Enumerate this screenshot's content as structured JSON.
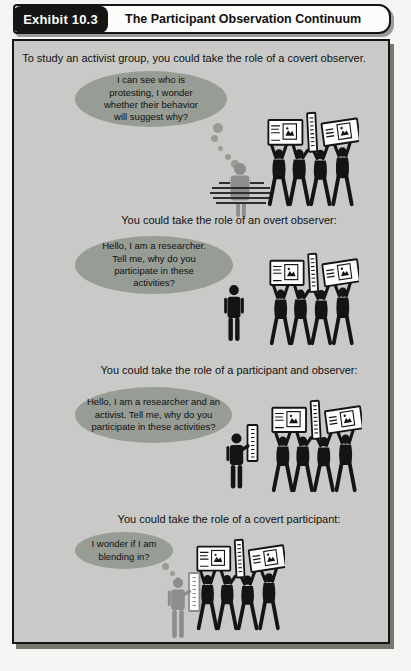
{
  "header": {
    "exhibit_label": "Exhibit 10.3",
    "title": "The Participant Observation Continuum"
  },
  "sections": [
    {
      "intro": "To study an activist group, you could take the role of a covert observer.",
      "bubble": "I can see who is protesting, I wonder whether their behavior will suggest why?",
      "bubble_type": "thought",
      "scene": "covert-observer-behind-hedge-watching-protest-group"
    },
    {
      "intro": "You could take the role of an overt observer:",
      "bubble": "Hello, I am a researcher. Tell me, why do you participate in these activities?",
      "bubble_type": "speech",
      "scene": "overt-observer-standing-beside-protest-group"
    },
    {
      "intro": "You could take the role of a participant and observer:",
      "bubble": "Hello, I am a researcher and an activist. Tell me, why do you participate in these activities?",
      "bubble_type": "speech",
      "scene": "participant-observer-holding-sign-beside-protest-group"
    },
    {
      "intro": "You could take the role of a covert participant:",
      "bubble": "I wonder if I am blending in?",
      "bubble_type": "thought",
      "scene": "covert-participant-with-sign-blending-into-protest-group"
    }
  ],
  "colors": {
    "panel_bg": "#c9c9c7",
    "bubble": "#979c94",
    "figure_black": "#141414",
    "figure_gray": "#8d8d8d",
    "header_tab_bg": "#151515",
    "header_bar_bg": "#fcfcfa"
  }
}
